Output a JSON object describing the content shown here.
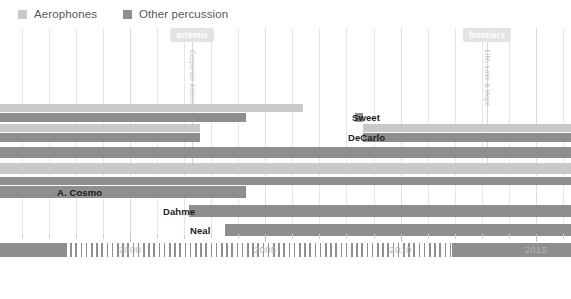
{
  "legend": {
    "items": [
      {
        "label": "Aerophones",
        "color": "#c9c9cb",
        "icon": "square-swatch-icon"
      },
      {
        "label": "Other percussion",
        "color": "#8e8e90",
        "icon": "square-swatch-icon"
      }
    ]
  },
  "annotations": [
    {
      "tag": "artemis",
      "vertical_text": "Corporate America",
      "year": 2002.3
    },
    {
      "tag": "frontiers",
      "vertical_text": "Life, Love & Hope",
      "year": 2013.2
    }
  ],
  "axis": {
    "tick_labels": [
      "2000",
      "2005",
      "2010",
      "2015"
    ],
    "tick_years": [
      2000,
      2005,
      2010,
      2015
    ],
    "xmin": 1995.2,
    "xmax": 2016.3
  },
  "chart_data": {
    "type": "bar",
    "orientation": "horizontal",
    "title": "",
    "xlabel": "",
    "ylabel": "",
    "xlim": [
      1995.2,
      2016.3
    ],
    "grid": true,
    "legend_position": "top-left",
    "series": [
      {
        "name": "Aerophones",
        "color": "#c9c9cb"
      },
      {
        "name": "Other percussion",
        "color": "#8e8e90"
      }
    ],
    "rows": [
      {
        "label": "",
        "segments": [
          {
            "series": "Aerophones",
            "start": 1995.2,
            "end": 2006.4,
            "style": "solid"
          }
        ]
      },
      {
        "label": "Sweet",
        "segments": [
          {
            "series": "Other percussion",
            "start": 1995.2,
            "end": 2004.3,
            "style": "solid"
          },
          {
            "series": "Other percussion",
            "start": 2008.3,
            "end": 2008.6,
            "style": "solid"
          }
        ]
      },
      {
        "label": "",
        "segments": [
          {
            "series": "Aerophones",
            "start": 1995.2,
            "end": 2002.6,
            "style": "solid"
          },
          {
            "series": "Aerophones",
            "start": 2008.6,
            "end": 2016.3,
            "style": "solid"
          }
        ]
      },
      {
        "label": "DeCarlo",
        "segments": [
          {
            "series": "Other percussion",
            "start": 1995.2,
            "end": 2002.6,
            "style": "solid"
          },
          {
            "series": "Other percussion",
            "start": 2008.6,
            "end": 2016.3,
            "style": "solid"
          }
        ]
      },
      {
        "label": "",
        "segments": [
          {
            "series": "Other percussion",
            "start": 1995.2,
            "end": 2016.3,
            "style": "solid"
          }
        ]
      },
      {
        "label": "",
        "segments": [
          {
            "series": "Aerophones",
            "start": 1995.2,
            "end": 2016.3,
            "style": "solid"
          }
        ]
      },
      {
        "label": "",
        "segments": [
          {
            "series": "Other percussion",
            "start": 1995.2,
            "end": 2016.3,
            "style": "solid"
          }
        ]
      },
      {
        "label": "A. Cosmo",
        "segments": [
          {
            "series": "Other percussion",
            "start": 1995.2,
            "end": 2004.3,
            "style": "solid"
          }
        ]
      },
      {
        "label": "Dahme",
        "segments": [
          {
            "series": "Other percussion",
            "start": 2002.2,
            "end": 2016.3,
            "style": "solid"
          }
        ]
      },
      {
        "label": "Neal",
        "segments": [
          {
            "series": "Other percussion",
            "start": 2003.5,
            "end": 2016.3,
            "style": "solid"
          }
        ]
      },
      {
        "label": "",
        "segments": [
          {
            "series": "Other percussion",
            "start": 1995.2,
            "end": 1997.6,
            "style": "solid"
          },
          {
            "series": "Other percussion",
            "start": 1997.6,
            "end": 2011.9,
            "style": "hatched"
          },
          {
            "series": "Other percussion",
            "start": 2011.9,
            "end": 2016.3,
            "style": "solid"
          }
        ]
      }
    ]
  },
  "layout": {
    "row_tops": [
      104,
      113,
      124,
      133,
      147,
      163,
      177,
      186,
      205,
      224,
      243
    ],
    "row_heights": [
      8,
      9,
      8,
      9,
      11,
      11,
      8,
      12,
      12,
      12,
      14
    ],
    "label_rows": {
      "1": "Sweet",
      "3": "DeCarlo",
      "7": "A. Cosmo",
      "8": "Dahme",
      "9": "Neal"
    },
    "label_x": {
      "1": 352,
      "3": 348,
      "7": 57,
      "8": 163,
      "9": 190
    }
  }
}
